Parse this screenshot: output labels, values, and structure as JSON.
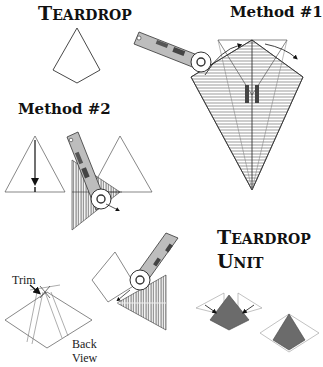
{
  "titles": {
    "teardrop": {
      "first": "T",
      "rest": "EARDROP"
    },
    "method1": "Method #1",
    "method2": "Method #2",
    "unit_line1": {
      "first": "T",
      "rest": "EARDROP"
    },
    "unit_line2": {
      "first": "U",
      "rest": "NIT"
    }
  },
  "labels": {
    "trim": "Trim",
    "back": "Back",
    "view": "View"
  },
  "colors": {
    "line": "#333333",
    "fill_dark": "#6b6b6b",
    "ruler_handle": "#b8b8b8"
  }
}
